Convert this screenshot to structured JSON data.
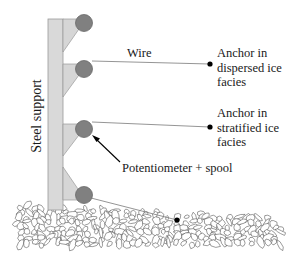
{
  "diagram": {
    "labels": {
      "steel_support": "Steel support",
      "wire": "Wire",
      "anchor_dispersed": [
        "Anchor in",
        "dispersed ice",
        "facies"
      ],
      "anchor_stratified": [
        "Anchor in",
        "stratified ice",
        "facies"
      ],
      "potentiometer": "Potentiometer + spool"
    },
    "components": {
      "post": "steel-support",
      "potentiometers": 4,
      "anchors": 3
    },
    "colors": {
      "post_fill": "#d9d9d9",
      "post_stroke": "#9a9a9a",
      "bracket_fill": "#d6d6d6",
      "spool_fill": "#808080",
      "spool_stroke": "#6a6a6a",
      "wire": "#7a7a7a",
      "anchor": "#000000",
      "arrow": "#000000",
      "text": "#1a1a1a"
    }
  }
}
